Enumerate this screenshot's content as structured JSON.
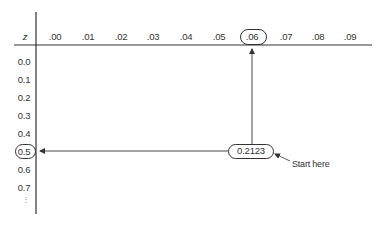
{
  "table": {
    "corner_label": "z",
    "column_headers": [
      ".00",
      ".01",
      ".02",
      ".03",
      ".04",
      ".05",
      ".06",
      ".07",
      ".08",
      ".09"
    ],
    "row_labels": [
      "0.0",
      "0.1",
      "0.2",
      "0.3",
      "0.4",
      "0.5",
      "0.6",
      "0.7"
    ],
    "continuation": "⋮"
  },
  "highlight": {
    "column": ".06",
    "row": "0.5",
    "value": "0.2123"
  },
  "annotation": {
    "label": "Start here"
  },
  "colors": {
    "line": "#333333",
    "text": "#333333"
  }
}
